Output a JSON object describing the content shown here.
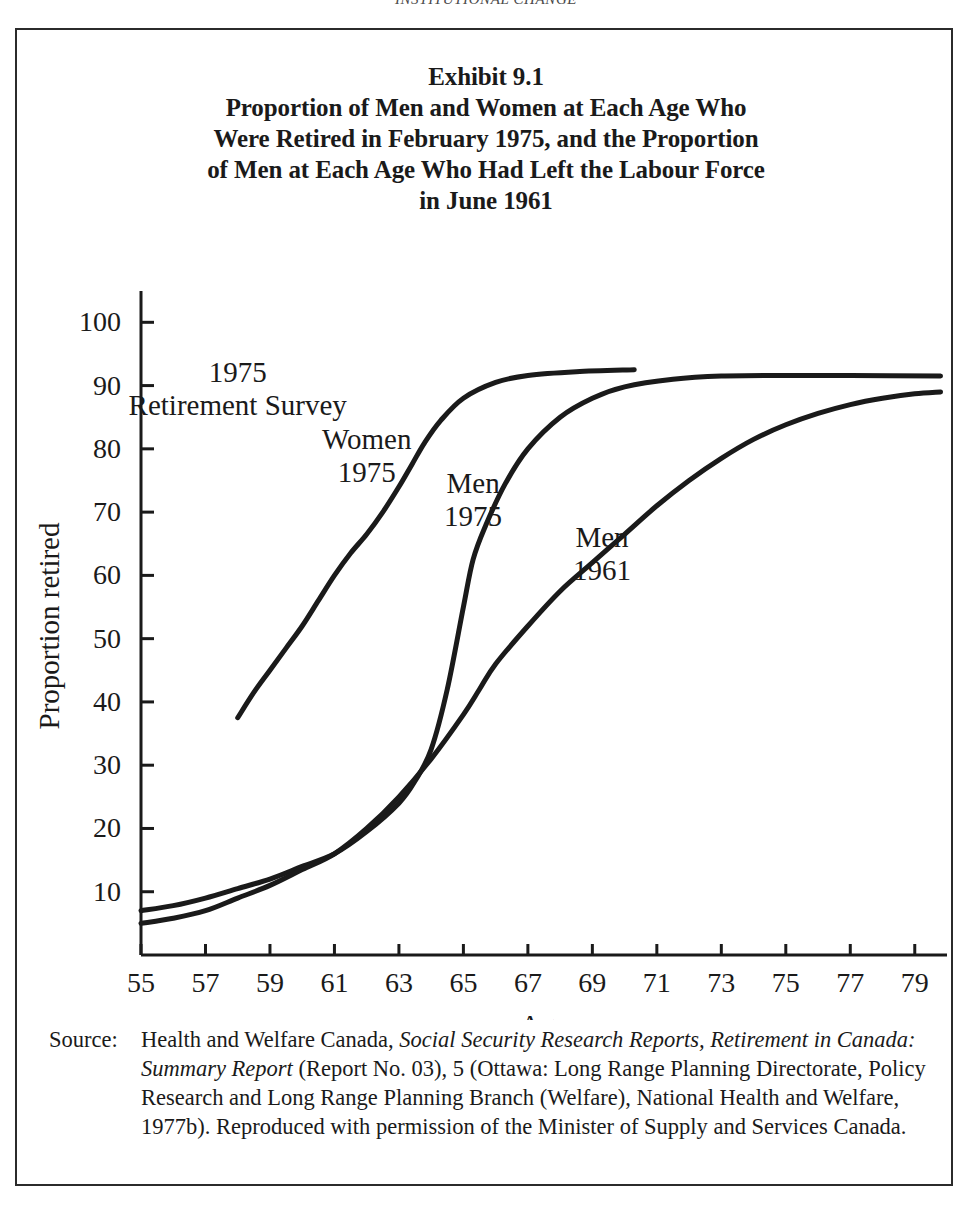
{
  "running_head": "INSTITUTIONAL CHANGE",
  "figure": {
    "title_lines": [
      "Exhibit 9.1",
      "Proportion of Men and Women at Each Age Who",
      "Were Retired in February 1975, and the Proportion",
      "of Men at Each Age Who Had Left the Labour Force",
      "in June 1961"
    ],
    "source_label": "Source:",
    "source_segments": [
      {
        "text": "Health and Welfare Canada, ",
        "italic": false
      },
      {
        "text": "Social Security Research Reports, Retirement in Canada: Summary Report",
        "italic": true
      },
      {
        "text": " (Report No. 03), 5 (Ottawa: Long Range Planning Directorate, Policy Research and Long Range Planning Branch (Welfare), National Health and Welfare, 1977b). Reproduced with permission of the Minister of Supply and Services Canada.",
        "italic": false
      }
    ]
  },
  "chart_data": {
    "type": "line",
    "title": "Proportion of Men and Women at Each Age Who Were Retired in February 1975, and the Proportion of Men at Each Age Who Had Left the Labour Force in June 1961",
    "xlabel": "Age",
    "ylabel": "Proportion retired",
    "xlim": [
      55,
      80
    ],
    "ylim": [
      0,
      104
    ],
    "xticks": [
      55,
      57,
      59,
      61,
      63,
      65,
      67,
      69,
      71,
      73,
      75,
      77,
      79
    ],
    "yticks": [
      10,
      20,
      30,
      40,
      50,
      60,
      70,
      80,
      90,
      100
    ],
    "grid": false,
    "legend": "inline-annotations",
    "line_color": "#1a1a1a",
    "annotations": [
      {
        "name": "survey-label",
        "lines": [
          "1975",
          "Retirement Survey"
        ],
        "x": 58.0,
        "y": 90.5
      },
      {
        "name": "women-1975-label",
        "lines": [
          "Women",
          "1975"
        ],
        "x": 62.0,
        "y": 80.0
      },
      {
        "name": "men-1975-label",
        "lines": [
          "Men",
          "1975"
        ],
        "x": 65.3,
        "y": 73.0
      },
      {
        "name": "men-1961-label",
        "lines": [
          "Men",
          "1961"
        ],
        "x": 69.3,
        "y": 64.5
      }
    ],
    "series": [
      {
        "name": "Women 1975",
        "points": [
          [
            58.0,
            37.5
          ],
          [
            58.5,
            41.5
          ],
          [
            59.0,
            45.0
          ],
          [
            59.5,
            48.5
          ],
          [
            60.0,
            52.0
          ],
          [
            60.5,
            56.0
          ],
          [
            61.0,
            60.0
          ],
          [
            61.5,
            63.5
          ],
          [
            62.0,
            66.5
          ],
          [
            62.5,
            70.0
          ],
          [
            63.0,
            74.0
          ],
          [
            63.4,
            77.5
          ],
          [
            63.8,
            81.0
          ],
          [
            64.3,
            84.5
          ],
          [
            65.0,
            88.0
          ],
          [
            66.0,
            90.5
          ],
          [
            67.0,
            91.6
          ],
          [
            68.5,
            92.2
          ],
          [
            70.3,
            92.5
          ]
        ]
      },
      {
        "name": "Men 1975",
        "points": [
          [
            55.0,
            7.0
          ],
          [
            56.0,
            7.8
          ],
          [
            57.0,
            9.0
          ],
          [
            58.0,
            10.5
          ],
          [
            59.0,
            12.0
          ],
          [
            60.0,
            14.0
          ],
          [
            61.0,
            16.0
          ],
          [
            62.0,
            19.5
          ],
          [
            63.0,
            24.0
          ],
          [
            63.5,
            27.5
          ],
          [
            64.0,
            32.5
          ],
          [
            64.5,
            42.0
          ],
          [
            65.0,
            55.0
          ],
          [
            65.3,
            62.5
          ],
          [
            65.7,
            68.0
          ],
          [
            66.3,
            74.5
          ],
          [
            67.0,
            80.0
          ],
          [
            68.0,
            85.0
          ],
          [
            69.0,
            88.0
          ],
          [
            70.0,
            89.8
          ],
          [
            71.5,
            91.0
          ],
          [
            73.0,
            91.5
          ],
          [
            75.0,
            91.6
          ],
          [
            77.0,
            91.6
          ],
          [
            79.8,
            91.5
          ]
        ]
      },
      {
        "name": "Men 1961",
        "points": [
          [
            55.0,
            5.0
          ],
          [
            56.0,
            5.8
          ],
          [
            57.0,
            7.0
          ],
          [
            58.0,
            9.0
          ],
          [
            59.0,
            11.0
          ],
          [
            60.0,
            13.5
          ],
          [
            61.0,
            16.0
          ],
          [
            62.0,
            20.0
          ],
          [
            63.0,
            25.0
          ],
          [
            64.0,
            31.0
          ],
          [
            65.0,
            38.0
          ],
          [
            65.5,
            42.0
          ],
          [
            66.0,
            46.0
          ],
          [
            67.0,
            52.0
          ],
          [
            68.0,
            57.5
          ],
          [
            69.0,
            62.0
          ],
          [
            70.0,
            66.5
          ],
          [
            71.0,
            71.0
          ],
          [
            72.0,
            75.0
          ],
          [
            73.0,
            78.5
          ],
          [
            74.0,
            81.5
          ],
          [
            75.0,
            83.8
          ],
          [
            76.0,
            85.6
          ],
          [
            77.0,
            87.0
          ],
          [
            78.0,
            88.0
          ],
          [
            79.0,
            88.7
          ],
          [
            79.8,
            89.0
          ]
        ]
      }
    ]
  }
}
